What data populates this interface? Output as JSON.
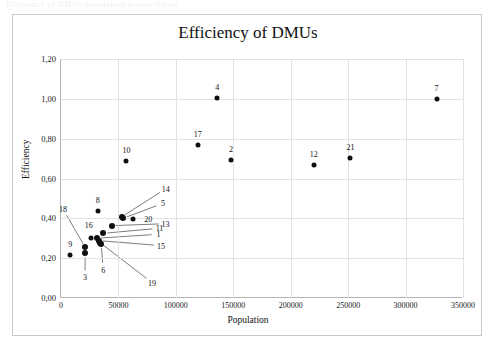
{
  "scan": {
    "header_text": "Efficiency of DMUs population scatter figure"
  },
  "chart": {
    "title": "Efficiency of DMUs",
    "xlabel": "Population",
    "ylabel": "Efficiency"
  },
  "axis": {
    "y_ticks": [
      "0,00",
      "0,20",
      "0,40",
      "0,60",
      "0,80",
      "1,00",
      "1,20"
    ],
    "x_ticks": [
      "0",
      "50000",
      "100000",
      "150000",
      "200000",
      "250000",
      "300000",
      "350000"
    ]
  },
  "colors": {
    "marker": "#101010",
    "grid": "#e2e2e2",
    "axis": "#b4b4b4",
    "frame": "#c9c9c9",
    "text": "#111111",
    "background": "#ffffff"
  },
  "chart_data": {
    "type": "scatter",
    "title": "Efficiency of DMUs",
    "xlabel": "Population",
    "ylabel": "Efficiency",
    "xlim": [
      0,
      350000
    ],
    "ylim": [
      0.0,
      1.2
    ],
    "xticks": [
      0,
      50000,
      100000,
      150000,
      200000,
      250000,
      300000,
      350000
    ],
    "yticks": [
      0.0,
      0.2,
      0.4,
      0.6,
      0.8,
      1.0,
      1.2
    ],
    "grid": true,
    "legend": "none",
    "decimal_separator": ",",
    "point_label_key": "DMU",
    "points": [
      {
        "label": "1",
        "x": 31000,
        "y": 0.3,
        "label_dx": 62,
        "label_dy": -4,
        "leader": true
      },
      {
        "label": "2",
        "x": 148000,
        "y": 0.695,
        "label_dx": 0,
        "label_dy": -11,
        "leader": false
      },
      {
        "label": "3",
        "x": 21000,
        "y": 0.225,
        "label_dx": 0,
        "label_dy": 24,
        "leader": true
      },
      {
        "label": "4",
        "x": 136000,
        "y": 1.005,
        "label_dx": 0,
        "label_dy": -11,
        "leader": false
      },
      {
        "label": "5",
        "x": 54000,
        "y": 0.4,
        "label_dx": 40,
        "label_dy": -15,
        "leader": true
      },
      {
        "label": "6",
        "x": 35000,
        "y": 0.272,
        "label_dx": 2,
        "label_dy": 26,
        "leader": true
      },
      {
        "label": "7",
        "x": 327000,
        "y": 1.0,
        "label_dx": 0,
        "label_dy": -11,
        "leader": false
      },
      {
        "label": "8",
        "x": 32000,
        "y": 0.435,
        "label_dx": 0,
        "label_dy": -11,
        "leader": false
      },
      {
        "label": "9",
        "x": 8000,
        "y": 0.215,
        "label_dx": 0,
        "label_dy": -11,
        "leader": false
      },
      {
        "label": "10",
        "x": 57000,
        "y": 0.69,
        "label_dx": 0,
        "label_dy": -11,
        "leader": false
      },
      {
        "label": "11",
        "x": 37000,
        "y": 0.325,
        "label_dx": 56,
        "label_dy": -5,
        "leader": true
      },
      {
        "label": "12",
        "x": 220000,
        "y": 0.67,
        "label_dx": 0,
        "label_dy": -11,
        "leader": false
      },
      {
        "label": "13",
        "x": 44000,
        "y": 0.363,
        "label_dx": 54,
        "label_dy": -2,
        "leader": true
      },
      {
        "label": "14",
        "x": 53000,
        "y": 0.408,
        "label_dx": 44,
        "label_dy": -28,
        "leader": true
      },
      {
        "label": "15",
        "x": 33000,
        "y": 0.288,
        "label_dx": 62,
        "label_dy": 5,
        "leader": true
      },
      {
        "label": "16",
        "x": 26000,
        "y": 0.3,
        "label_dx": -2,
        "label_dy": -13,
        "leader": false
      },
      {
        "label": "17",
        "x": 119000,
        "y": 0.77,
        "label_dx": 0,
        "label_dy": -11,
        "leader": false
      },
      {
        "label": "18",
        "x": 21000,
        "y": 0.255,
        "label_dx": -22,
        "label_dy": -38,
        "leader": true
      },
      {
        "label": "19",
        "x": 34000,
        "y": 0.278,
        "label_dx": 52,
        "label_dy": 40,
        "leader": true
      },
      {
        "label": "20",
        "x": 63000,
        "y": 0.398,
        "label_dx": 15,
        "label_dy": 0,
        "leader": false
      },
      {
        "label": "21",
        "x": 252000,
        "y": 0.705,
        "label_dx": 0,
        "label_dy": -11,
        "leader": false
      }
    ]
  }
}
